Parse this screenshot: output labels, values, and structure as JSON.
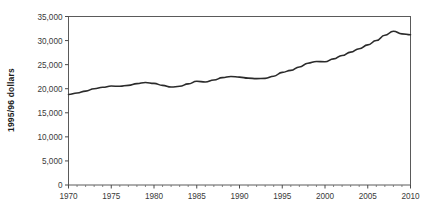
{
  "chart_data": {
    "type": "line",
    "title": "",
    "xlabel": "",
    "ylabel": "1995/96 dollars",
    "xlim": [
      1970,
      2010
    ],
    "ylim": [
      0,
      35000
    ],
    "grid": false,
    "legend": "none",
    "y_ticks": [
      0,
      5000,
      10000,
      15000,
      20000,
      25000,
      30000,
      35000
    ],
    "y_tick_labels": [
      "0",
      "5,000",
      "10,000",
      "15,000",
      "20,000",
      "25,000",
      "30,000",
      "35,000"
    ],
    "x_ticks": [
      1970,
      1975,
      1980,
      1985,
      1990,
      1995,
      2000,
      2005,
      2010
    ],
    "x_tick_labels": [
      "1970",
      "1975",
      "1980",
      "1985",
      "1990",
      "1995",
      "2000",
      "2005",
      "2010"
    ],
    "x_minor_tick_interval": 1,
    "series": [
      {
        "name": "1995/96 dollars",
        "color": "#2b2b2b",
        "x": [
          1970,
          1971,
          1972,
          1973,
          1974,
          1975,
          1976,
          1977,
          1978,
          1979,
          1980,
          1981,
          1982,
          1983,
          1984,
          1985,
          1986,
          1987,
          1988,
          1989,
          1990,
          1991,
          1992,
          1993,
          1994,
          1995,
          1996,
          1997,
          1998,
          1999,
          2000,
          2001,
          2002,
          2003,
          2004,
          2005,
          2006,
          2007,
          2008,
          2009,
          2010
        ],
        "values": [
          18800,
          19100,
          19500,
          20000,
          20300,
          20550,
          20500,
          20700,
          21050,
          21300,
          21100,
          20700,
          20350,
          20500,
          21000,
          21550,
          21400,
          21800,
          22300,
          22550,
          22400,
          22200,
          22100,
          22150,
          22600,
          23400,
          23800,
          24500,
          25300,
          25650,
          25600,
          26200,
          26900,
          27600,
          28300,
          29100,
          30000,
          31100,
          31950,
          31400,
          31200
        ]
      }
    ]
  },
  "axes": {
    "y_axis_title": "1995/96 dollars"
  }
}
